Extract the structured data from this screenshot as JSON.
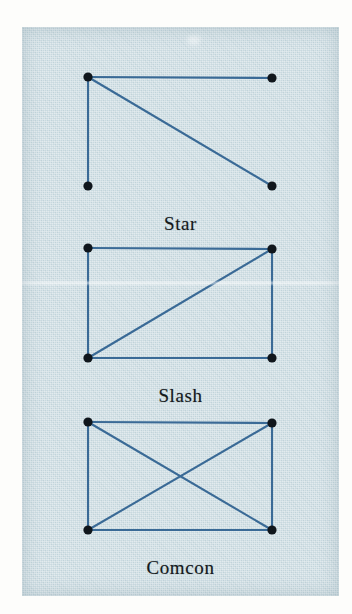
{
  "page": {
    "background_color": "#fdfdfb",
    "paper_color": "#c8d9df",
    "ink_color": "#3a6a96",
    "node_color": "#10161c",
    "caption_color": "#15191c"
  },
  "figures": [
    {
      "id": "star",
      "caption": "Star",
      "caption_y": 186,
      "nodes": [
        {
          "name": "top-left",
          "x": 66,
          "y": 50
        },
        {
          "name": "top-right",
          "x": 250,
          "y": 51
        },
        {
          "name": "bottom-left",
          "x": 66,
          "y": 159
        },
        {
          "name": "bottom-right",
          "x": 250,
          "y": 159
        }
      ],
      "edges": [
        {
          "from": "top-left",
          "to": "top-right"
        },
        {
          "from": "top-left",
          "to": "bottom-left"
        },
        {
          "from": "top-left",
          "to": "bottom-right"
        }
      ]
    },
    {
      "id": "slash",
      "caption": "Slash",
      "caption_y": 358,
      "nodes": [
        {
          "name": "top-left",
          "x": 66,
          "y": 221
        },
        {
          "name": "top-right",
          "x": 250,
          "y": 222
        },
        {
          "name": "bottom-left",
          "x": 66,
          "y": 331
        },
        {
          "name": "bottom-right",
          "x": 250,
          "y": 331
        }
      ],
      "edges": [
        {
          "from": "top-left",
          "to": "top-right"
        },
        {
          "from": "top-right",
          "to": "bottom-right"
        },
        {
          "from": "bottom-right",
          "to": "bottom-left"
        },
        {
          "from": "bottom-left",
          "to": "top-left"
        },
        {
          "from": "bottom-left",
          "to": "top-right"
        }
      ]
    },
    {
      "id": "comcon",
      "caption": "Comcon",
      "caption_y": 530,
      "nodes": [
        {
          "name": "top-left",
          "x": 66,
          "y": 395
        },
        {
          "name": "top-right",
          "x": 250,
          "y": 396
        },
        {
          "name": "bottom-left",
          "x": 66,
          "y": 503
        },
        {
          "name": "bottom-right",
          "x": 250,
          "y": 503
        }
      ],
      "edges": [
        {
          "from": "top-left",
          "to": "top-right"
        },
        {
          "from": "top-right",
          "to": "bottom-right"
        },
        {
          "from": "bottom-right",
          "to": "bottom-left"
        },
        {
          "from": "bottom-left",
          "to": "top-left"
        },
        {
          "from": "top-left",
          "to": "bottom-right"
        },
        {
          "from": "bottom-left",
          "to": "top-right"
        }
      ]
    }
  ]
}
